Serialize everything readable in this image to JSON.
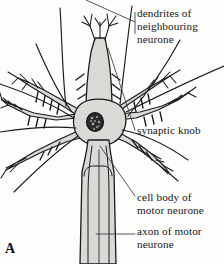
{
  "figure": {
    "panel_letter": "A",
    "subject": "motor neurone",
    "background_color": "#fdfdfb",
    "ink_color": "#1a1a1e",
    "cell_fill_color": "#d9d9d6",
    "nucleus_color": "#2b2b2e",
    "leader_line_color": "#3a3a40"
  },
  "labels": [
    {
      "id": "dendrites",
      "name": "dendrites-of-neighbouring-neurone-label",
      "lines": [
        "dendrites of",
        "neighbouring",
        "neurone"
      ]
    },
    {
      "id": "synaptic",
      "name": "synaptic-knob-label",
      "lines": [
        "synaptic knob"
      ]
    },
    {
      "id": "cellbody",
      "name": "cell-body-of-motor-neurone-label",
      "lines": [
        "cell body of",
        "motor neurone"
      ]
    },
    {
      "id": "axon",
      "name": "axon-of-motor-neurone-label",
      "lines": [
        "axon of motor",
        "neurone"
      ]
    }
  ],
  "label_text": {
    "dendrites_line1": "dendrites of",
    "dendrites_line2": "neighbouring",
    "dendrites_line3": "neurone",
    "synaptic_line1": "synaptic knob",
    "cellbody_line1": "cell body of",
    "cellbody_line2": "motor neurone",
    "axon_line1": "axon of motor",
    "axon_line2": "neurone"
  },
  "diagram_parts": [
    "cell-body",
    "nucleus",
    "upper-dendrite",
    "upper-left-dendrite",
    "left-dendrite",
    "lower-left-dendrite",
    "upper-right-dendrite",
    "right-dendrite",
    "lower-right-dendrite",
    "axon",
    "synaptic-knobs",
    "neighbouring-neurone-axons"
  ]
}
